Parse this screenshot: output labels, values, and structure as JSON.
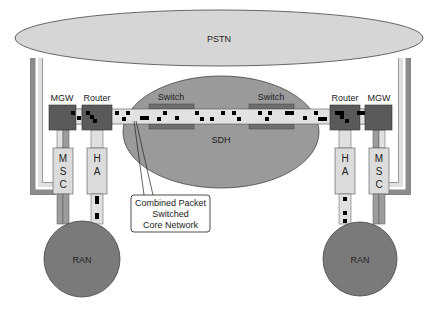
{
  "diagram": {
    "pstn": {
      "label": "PSTN",
      "fill": "#d6d6d6"
    },
    "sdh": {
      "label": "SDH",
      "fill": "#9a9a9a"
    },
    "switches": [
      {
        "label": "Switch"
      },
      {
        "label": "Switch"
      }
    ],
    "left": {
      "mgw": {
        "label": "MGW"
      },
      "router": {
        "label": "Router"
      },
      "msc": {
        "label": "MSC",
        "letters": [
          "M",
          "S",
          "C"
        ]
      },
      "ha": {
        "label": "HA",
        "letters": [
          "H",
          "A"
        ]
      },
      "ran": {
        "label": "RAN"
      }
    },
    "right": {
      "mgw": {
        "label": "MGW"
      },
      "router": {
        "label": "Router"
      },
      "msc": {
        "label": "MSC",
        "letters": [
          "M",
          "S",
          "C"
        ]
      },
      "ha": {
        "label": "HA",
        "letters": [
          "H",
          "A"
        ]
      },
      "ran": {
        "label": "RAN"
      }
    },
    "callout": {
      "lines": [
        "Combined Packet",
        "Switched",
        "Core Network"
      ]
    },
    "colors": {
      "node_dark": "#5a5a5a",
      "box_light": "#dcdcdc",
      "packet_bar": "#e2e2e2",
      "packet": "#000000",
      "ran": "#7a7a7a",
      "link_mid": "#9c9c9c",
      "link_light": "#e6e6e6"
    }
  }
}
